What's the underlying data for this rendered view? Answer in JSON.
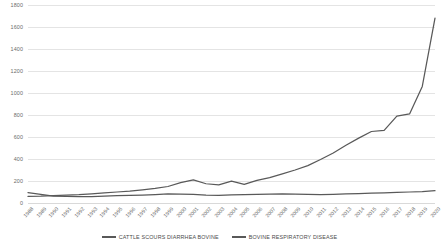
{
  "chart_data": {
    "type": "line",
    "title": "",
    "xlabel": "",
    "ylabel": "",
    "ylim": [
      0,
      1800
    ],
    "ytick_step": 200,
    "grid": true,
    "legend_position": "bottom",
    "line_color": "#595959",
    "gridline_color": "#e4e4e4",
    "background": "#ffffff",
    "yticks": [
      1800,
      1600,
      1400,
      1200,
      1000,
      800,
      600,
      400,
      200,
      0
    ],
    "categories": [
      "1988",
      "1989",
      "1990",
      "1991",
      "1992",
      "1993",
      "1994",
      "1995",
      "1996",
      "1997",
      "1998",
      "1999",
      "2000",
      "2001",
      "2002",
      "2003",
      "2004",
      "2005",
      "2006",
      "2007",
      "2008",
      "2009",
      "2010",
      "2011",
      "2012",
      "2013",
      "2014",
      "2015",
      "2016",
      "2017",
      "2018",
      "2019",
      "2020"
    ],
    "series": [
      {
        "name": "CATTLE SCOURS DIARRHEA BOVINE",
        "values": [
          95,
          78,
          62,
          60,
          58,
          58,
          62,
          66,
          70,
          72,
          76,
          82,
          80,
          78,
          72,
          70,
          74,
          76,
          78,
          80,
          82,
          80,
          78,
          76,
          78,
          82,
          86,
          90,
          92,
          96,
          100,
          104,
          112
        ]
      },
      {
        "name": "BOVINE RESPIRATORY DISEASE",
        "values": [
          60,
          62,
          68,
          72,
          76,
          84,
          92,
          100,
          108,
          120,
          132,
          150,
          185,
          210,
          175,
          165,
          198,
          170,
          205,
          230,
          265,
          300,
          340,
          395,
          455,
          525,
          590,
          650,
          660,
          790,
          810,
          1060,
          1680
        ]
      }
    ],
    "legend": [
      "CATTLE SCOURS DIARRHEA BOVINE",
      "BOVINE RESPIRATORY DISEASE"
    ]
  }
}
